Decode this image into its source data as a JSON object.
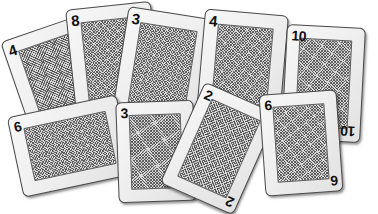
{
  "scene": {
    "title": "Scattered face-down playing cards",
    "background_color": "#ffffff",
    "card_count": 9,
    "card_face_color": "#efefef",
    "card_border_color": "#4a4a4a",
    "card_pattern_color": "#d8d8d8",
    "rank_text_color": "#111111"
  },
  "cards": [
    {
      "id": "card-4-left",
      "rank": "4",
      "rank_corner_top_left": "4",
      "rank_corner_bottom_right": "4",
      "x": 17,
      "y": 25,
      "w": 86,
      "h": 118,
      "rotate": -19,
      "z": 1
    },
    {
      "id": "card-8",
      "rank": "8",
      "rank_corner_top_left": "8",
      "rank_corner_bottom_right": "8",
      "x": 71,
      "y": 5,
      "w": 86,
      "h": 118,
      "rotate": -6,
      "z": 2
    },
    {
      "id": "card-3-top",
      "rank": "3",
      "rank_corner_top_left": "3",
      "rank_corner_bottom_right": "3",
      "x": 119,
      "y": 12,
      "w": 86,
      "h": 118,
      "rotate": 9,
      "z": 3
    },
    {
      "id": "card-4-right",
      "rank": "4",
      "rank_corner_top_left": "4",
      "rank_corner_bottom_right": "4",
      "x": 200,
      "y": 12,
      "w": 84,
      "h": 116,
      "rotate": 5,
      "z": 4
    },
    {
      "id": "card-10",
      "rank": "10",
      "rank_corner_top_left": "10",
      "rank_corner_bottom_right": "10",
      "x": 284,
      "y": 26,
      "w": 79,
      "h": 115,
      "rotate": 3,
      "z": 5
    },
    {
      "id": "card-6-left",
      "rank": "6",
      "rank_corner_top_left": "6",
      "rank_corner_bottom_right": "6",
      "x": 14,
      "y": 105,
      "w": 112,
      "h": 82,
      "rotate": -12,
      "z": 6
    },
    {
      "id": "card-3-bottom",
      "rank": "3",
      "rank_corner_top_left": "3",
      "rank_corner_bottom_right": "3",
      "x": 117,
      "y": 101,
      "w": 78,
      "h": 101,
      "rotate": -2,
      "z": 7
    },
    {
      "id": "card-2",
      "rank": "2",
      "rank_corner_top_left": "2",
      "rank_corner_bottom_right": "2",
      "x": 179,
      "y": 93,
      "w": 80,
      "h": 111,
      "rotate": 24,
      "z": 8
    },
    {
      "id": "card-6-right",
      "rank": "6",
      "rank_corner_top_left": "6",
      "rank_corner_bottom_right": "6",
      "x": 262,
      "y": 92,
      "w": 78,
      "h": 102,
      "rotate": -4,
      "z": 9
    }
  ]
}
